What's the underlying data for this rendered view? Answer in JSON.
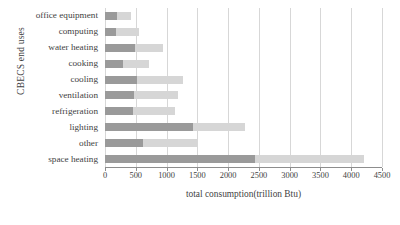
{
  "chart_data": {
    "type": "bar",
    "orientation": "horizontal",
    "stacked": true,
    "title": "",
    "xlabel": "total consumption(trillion Btu)",
    "ylabel": "CBECS end uses",
    "xlim": [
      0,
      4500
    ],
    "xticks": [
      0,
      500,
      1000,
      1500,
      2000,
      2500,
      3000,
      3500,
      4000,
      4500
    ],
    "grid": "vertical",
    "legend": "none",
    "categories": [
      "office equipment",
      "computing",
      "water heating",
      "cooking",
      "cooling",
      "ventilation",
      "refrigeration",
      "lighting",
      "other",
      "space heating"
    ],
    "series": [
      {
        "name": "segment-a",
        "color": "#9a9a9a",
        "values": [
          190,
          180,
          490,
          295,
          520,
          470,
          455,
          1430,
          620,
          2435
        ]
      },
      {
        "name": "segment-b",
        "color": "#d6d6d6",
        "values": [
          230,
          370,
          450,
          420,
          740,
          715,
          675,
          840,
          870,
          1765
        ]
      }
    ],
    "totals": [
      420,
      550,
      940,
      715,
      1260,
      1185,
      1130,
      2270,
      1490,
      4200
    ]
  },
  "colors": {
    "segment_a": "#9a9a9a",
    "segment_b": "#d6d6d6",
    "gridline": "#d7d7d7",
    "axis": "#8d8d8d",
    "text": "#3f3f3f",
    "background": "#ffffff"
  }
}
